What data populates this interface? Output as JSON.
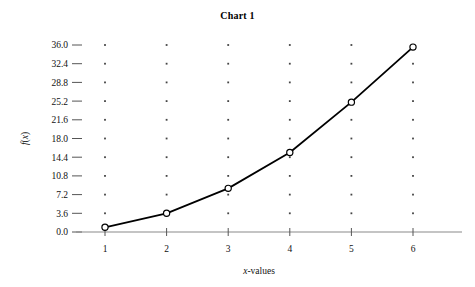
{
  "chart_data": {
    "type": "line",
    "title": "Chart 1",
    "xlabel": "x-values",
    "ylabel": "f(x)",
    "x": [
      1,
      2,
      3,
      4,
      5,
      6
    ],
    "values": [
      0.9,
      3.6,
      8.4,
      15.3,
      25.0,
      35.6
    ],
    "series": [
      {
        "name": "f(x)",
        "values": [
          0.9,
          3.6,
          8.4,
          15.3,
          25.0,
          35.6
        ]
      }
    ],
    "xtick_labels": [
      "1",
      "2",
      "3",
      "4",
      "5",
      "6"
    ],
    "ytick_labels": [
      "0.0",
      "3.6",
      "7.2",
      "10.8",
      "14.4",
      "18.0",
      "21.6",
      "25.2",
      "28.8",
      "32.4",
      "36.0"
    ],
    "ytick_values": [
      0.0,
      3.6,
      7.2,
      10.8,
      14.4,
      18.0,
      21.6,
      25.2,
      28.8,
      32.4,
      36.0
    ],
    "xlim": [
      1,
      6
    ],
    "ylim": [
      0,
      36
    ],
    "grid": "dotted-points",
    "legend": null,
    "marker": "open-circle",
    "line_color": "#000000",
    "marker_fill": "#ffffff",
    "marker_stroke": "#000000",
    "axis_color": "#8a8a8a",
    "grid_color": "#444444",
    "background": "#ffffff"
  }
}
